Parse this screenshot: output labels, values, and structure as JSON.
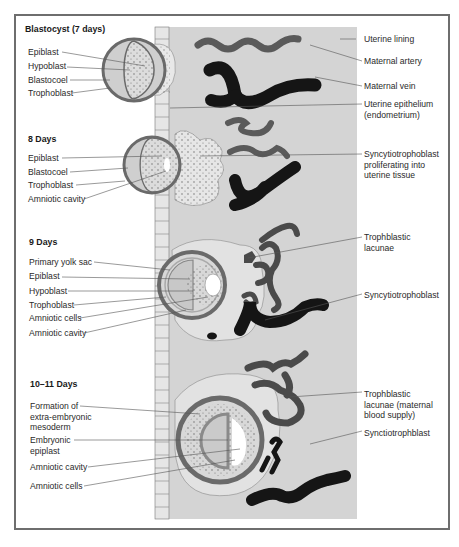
{
  "diagram": {
    "colors": {
      "frame": "#6e6e6e",
      "uterine_panel": "#d4d4d4",
      "artery": "#5a5a5a",
      "vein": "#151515",
      "trophoblast_ring": "#6a6a6a",
      "leader_line": "#555555"
    },
    "stages": [
      {
        "heading": "Blastocyst (7 days)",
        "left_labels": [
          "Epiblast",
          "Hypoblast",
          "Blastocoel",
          "Trophoblast"
        ]
      },
      {
        "heading": "8 Days",
        "left_labels": [
          "Epiblast",
          "Blastocoel",
          "Trophoblast",
          "Amniotic cavity"
        ]
      },
      {
        "heading": "9 Days",
        "left_labels": [
          "Primary yolk sac",
          "Epiblast",
          "Hypoblast",
          "Trophoblast",
          "Amniotic cells",
          "Amniotic cavity"
        ]
      },
      {
        "heading": "10–11 Days",
        "left_labels": [
          "Formation of\nextra-embryonic\nmesoderm",
          "Embryonic\nepiplast",
          "Amniotic cavity",
          "Amniotic cells"
        ]
      }
    ],
    "right_labels": [
      "Uterine lining",
      "Maternal artery",
      "Maternal vein",
      "Uterine epithelium\n(endometrium)",
      "Syncytiotrophoblast\nproliferating into\nuterine tissue",
      "Trophblastic\nlacunae",
      "Syncytiotrophoblast",
      "Trophblastic\nlacunae (maternal\nblood supply)",
      "Synctiotrophblast"
    ]
  }
}
